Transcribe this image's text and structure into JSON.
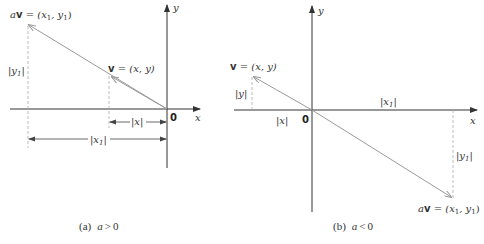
{
  "figure_a": {
    "caption": "(a)  a > 0",
    "caption_parts": {
      "tag": "(a)",
      "condition_var": "a",
      "condition_op": ">",
      "condition_val": "0"
    },
    "axis_x_label": "x",
    "axis_y_label": "y",
    "origin_label": "0",
    "av_label": {
      "prefix": "a",
      "vec": "v",
      "rest": " = (x",
      "sub1": "1",
      "mid": ", y",
      "sub2": "1",
      "end": ")"
    },
    "v_label": {
      "vec": "v",
      "rest": " = (x, y)"
    },
    "y1_label": {
      "text": "|y",
      "sub": "1",
      "end": "|"
    },
    "x_label": "|x|",
    "x1_label": {
      "text": "|x",
      "sub": "1",
      "end": "|"
    }
  },
  "figure_b": {
    "caption": "(b)  a < 0",
    "caption_parts": {
      "tag": "(b)",
      "condition_var": "a",
      "condition_op": "<",
      "condition_val": "0"
    },
    "axis_x_label": "x",
    "axis_y_label": "y",
    "origin_label": "0",
    "av_label": {
      "prefix": "a",
      "vec": "v",
      "rest": " = (x",
      "sub1": "1",
      "mid": ", y",
      "sub2": "1",
      "end": ")"
    },
    "v_label": {
      "vec": "v",
      "rest": " = (x, y)"
    },
    "y_label": "|y|",
    "x_label": "|x|",
    "x1_label": {
      "text": "|x",
      "sub": "1",
      "end": "|"
    },
    "y1_label": {
      "text": "|y",
      "sub": "1",
      "end": "|"
    }
  },
  "colors": {
    "axis": "#333333",
    "vector": "#9a9a9a",
    "dashed": "#aaaaaa",
    "text": "#333333"
  }
}
